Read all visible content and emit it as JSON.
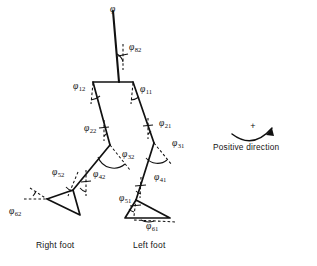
{
  "figure": {
    "kind": "biomechanical-gait-stick-figure",
    "background_color": "#ffffff",
    "line_color": "#111111",
    "dashed_color": "#111111",
    "captions": {
      "right_foot": "Right foot",
      "left_foot": "Left foot",
      "positive_direction": "Positive direction",
      "plus_sign": "+"
    },
    "angle_labels": [
      {
        "id": "phi82",
        "symbol": "φ",
        "subscript": "82",
        "x": 129,
        "y": 50,
        "segment": "trunk",
        "side": "upper-body"
      },
      {
        "id": "phi12",
        "symbol": "φ",
        "subscript": "12",
        "x": 73,
        "y": 89,
        "segment": "hip",
        "side": "right"
      },
      {
        "id": "phi11",
        "symbol": "φ",
        "subscript": "11",
        "x": 140,
        "y": 92,
        "segment": "hip",
        "side": "left"
      },
      {
        "id": "phi22",
        "symbol": "φ",
        "subscript": "22",
        "x": 84,
        "y": 131,
        "segment": "thigh",
        "side": "right"
      },
      {
        "id": "phi21",
        "symbol": "φ",
        "subscript": "21",
        "x": 159,
        "y": 126,
        "segment": "thigh",
        "side": "left"
      },
      {
        "id": "phi32",
        "symbol": "φ",
        "subscript": "32",
        "x": 122,
        "y": 157,
        "segment": "knee",
        "side": "right"
      },
      {
        "id": "phi31",
        "symbol": "φ",
        "subscript": "31",
        "x": 172,
        "y": 146,
        "segment": "knee",
        "side": "left"
      },
      {
        "id": "phi52",
        "symbol": "φ",
        "subscript": "52",
        "x": 52,
        "y": 175,
        "segment": "ankle",
        "side": "right"
      },
      {
        "id": "phi42",
        "symbol": "φ",
        "subscript": "42",
        "x": 93,
        "y": 177,
        "segment": "shank",
        "side": "right"
      },
      {
        "id": "phi41",
        "symbol": "φ",
        "subscript": "41",
        "x": 154,
        "y": 180,
        "segment": "shank",
        "side": "left"
      },
      {
        "id": "phi51",
        "symbol": "φ",
        "subscript": "51",
        "x": 119,
        "y": 201,
        "segment": "ankle",
        "side": "left"
      },
      {
        "id": "phi62",
        "symbol": "φ",
        "subscript": "62",
        "x": 9,
        "y": 214,
        "segment": "foot",
        "side": "right"
      },
      {
        "id": "phi61",
        "symbol": "φ",
        "subscript": "61",
        "x": 146,
        "y": 229,
        "segment": "foot",
        "side": "left"
      }
    ]
  }
}
